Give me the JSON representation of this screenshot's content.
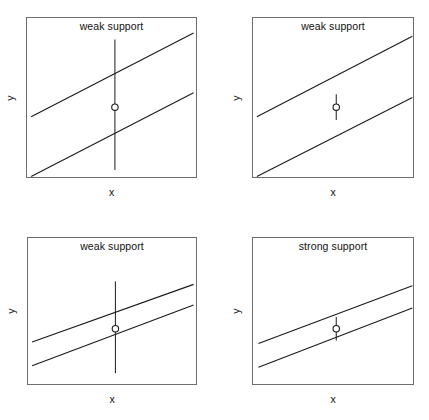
{
  "figure": {
    "width": 429,
    "height": 420,
    "background": "#ffffff",
    "line_color": "#1a1a1a",
    "frame_color": "#6e6e6e"
  },
  "axis_labels": {
    "x": "x",
    "y": "y"
  },
  "chart_data": {
    "type": "line",
    "title": "",
    "xlabel": "x",
    "ylabel": "y",
    "grid": false,
    "legend": "none",
    "panel_layout": "2x2",
    "panels": [
      {
        "position": "top-left",
        "title": "weak support",
        "xlabel": "x",
        "ylabel": "y",
        "band_width": "wide",
        "error_bar": "long",
        "frame": {
          "x": 26,
          "y": 17,
          "w": 171,
          "h": 161
        },
        "upper_line": {
          "x1": 0.03,
          "y1": 0.62,
          "x2": 0.98,
          "y2": 0.1
        },
        "lower_line": {
          "x1": 0.03,
          "y1": 0.99,
          "x2": 0.98,
          "y2": 0.47
        },
        "point": {
          "x": 0.52,
          "y": 0.56
        },
        "error_bar_range": {
          "top": 0.14,
          "bottom": 0.95
        }
      },
      {
        "position": "top-right",
        "title": "weak support",
        "xlabel": "x",
        "ylabel": "y",
        "band_width": "wide",
        "error_bar": "short",
        "frame": {
          "x": 252,
          "y": 17,
          "w": 162,
          "h": 161
        },
        "upper_line": {
          "x1": 0.03,
          "y1": 0.62,
          "x2": 0.99,
          "y2": 0.12
        },
        "lower_line": {
          "x1": 0.03,
          "y1": 0.99,
          "x2": 0.99,
          "y2": 0.5
        },
        "point": {
          "x": 0.52,
          "y": 0.56
        },
        "error_bar_range": {
          "top": 0.48,
          "bottom": 0.64
        }
      },
      {
        "position": "bottom-left",
        "title": "weak support",
        "xlabel": "x",
        "ylabel": "y",
        "band_width": "narrow",
        "error_bar": "long",
        "frame": {
          "x": 27,
          "y": 237,
          "w": 170,
          "h": 148
        },
        "upper_line": {
          "x1": 0.03,
          "y1": 0.71,
          "x2": 0.98,
          "y2": 0.32
        },
        "lower_line": {
          "x1": 0.03,
          "y1": 0.87,
          "x2": 0.98,
          "y2": 0.46
        },
        "point": {
          "x": 0.52,
          "y": 0.62
        },
        "error_bar_range": {
          "top": 0.3,
          "bottom": 0.92
        }
      },
      {
        "position": "bottom-right",
        "title": "strong support",
        "xlabel": "x",
        "ylabel": "y",
        "band_width": "narrow",
        "error_bar": "short",
        "frame": {
          "x": 252,
          "y": 237,
          "w": 162,
          "h": 148
        },
        "upper_line": {
          "x1": 0.04,
          "y1": 0.72,
          "x2": 0.99,
          "y2": 0.33
        },
        "lower_line": {
          "x1": 0.04,
          "y1": 0.88,
          "x2": 0.99,
          "y2": 0.48
        },
        "point": {
          "x": 0.52,
          "y": 0.62
        },
        "error_bar_range": {
          "top": 0.54,
          "bottom": 0.7
        }
      }
    ]
  }
}
